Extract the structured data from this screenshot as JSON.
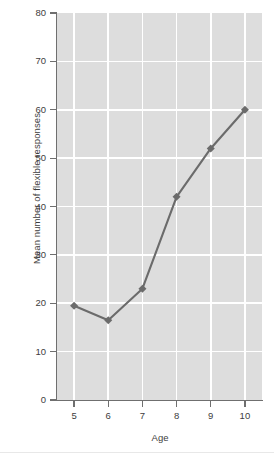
{
  "chart_data": {
    "type": "line",
    "title": "",
    "xlabel": "Age",
    "ylabel": "Mean number of flexible responses",
    "x": [
      5,
      6,
      7,
      8,
      9,
      10
    ],
    "values": [
      19.5,
      16.5,
      23,
      42,
      52,
      60
    ],
    "categories": [
      "5",
      "6",
      "7",
      "8",
      "9",
      "10"
    ],
    "xlim": [
      4.5,
      10.5
    ],
    "ylim": [
      0,
      80
    ],
    "xticks": [
      "5",
      "6",
      "7",
      "8",
      "9",
      "10"
    ],
    "yticks": [
      "0",
      "10",
      "20",
      "30",
      "40",
      "50",
      "60",
      "70",
      "80"
    ],
    "ytick_values": [
      0,
      10,
      20,
      30,
      40,
      50,
      60,
      70,
      80
    ],
    "grid": true,
    "legend": false,
    "series": [
      {
        "name": "Mean number of flexible responses",
        "values": [
          19.5,
          16.5,
          23,
          42,
          52,
          60
        ]
      }
    ],
    "marker": "diamond",
    "colors": {
      "plot_background": "#dddddd",
      "gridline": "#ffffff",
      "axis": "#6f6f6f",
      "series_line": "#6b6b6b",
      "marker": "#6b6b6b",
      "text": "#3d3d3d",
      "figure_background": "#ffffff"
    }
  }
}
